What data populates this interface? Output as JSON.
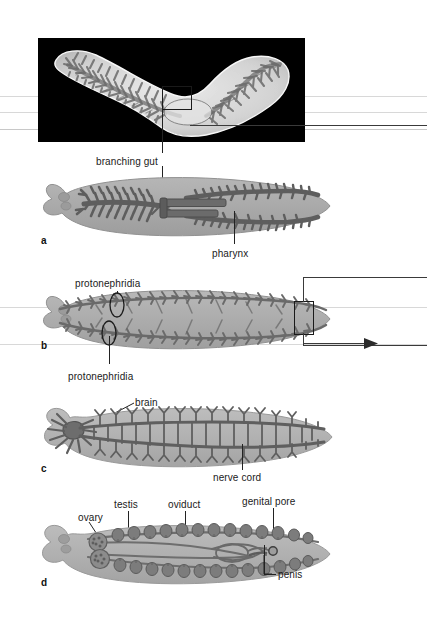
{
  "figure": {
    "type": "biological-anatomy-plate",
    "panel_count": 4
  },
  "photo": {
    "name": "micrograph",
    "description": "stained whole-mount light micrograph of a planarian showing branching gut on black background",
    "background_color": "#000000",
    "specimen_color": "#e8e8e8",
    "gut_color": "#6d6d6d",
    "callout_label": "branching gut"
  },
  "colors": {
    "body": "#a9a9a9",
    "body_light": "#c2c2c2",
    "body_edge": "#8f8f8f",
    "organ_dark": "#5e5e5e",
    "organ_mid": "#787878",
    "organ_light": "#9a9a9a",
    "leader": "#222222",
    "rule": "#d8d8d8",
    "text": "#1a1a1a"
  },
  "panels": [
    {
      "letter": "a",
      "name": "digestive-system-panel",
      "system": "digestive system",
      "labels": [
        {
          "text": "branching gut",
          "x": 96,
          "y": 157
        },
        {
          "text": "pharynx",
          "x": 212,
          "y": 249
        }
      ]
    },
    {
      "letter": "b",
      "name": "excretory-system-panel",
      "system": "excretory system",
      "labels": [
        {
          "text": "protonephridia",
          "x": 75,
          "y": 279
        },
        {
          "text": "protonephridia",
          "x": 68,
          "y": 372
        }
      ]
    },
    {
      "letter": "c",
      "name": "nervous-system-panel",
      "system": "nervous system",
      "labels": [
        {
          "text": "brain",
          "x": 135,
          "y": 398
        },
        {
          "text": "nerve cord",
          "x": 213,
          "y": 473
        }
      ]
    },
    {
      "letter": "d",
      "name": "reproductive-system-panel",
      "system": "reproductive system",
      "labels": [
        {
          "text": "ovary",
          "x": 78,
          "y": 513
        },
        {
          "text": "testis",
          "x": 114,
          "y": 500
        },
        {
          "text": "oviduct",
          "x": 168,
          "y": 500
        },
        {
          "text": "genital pore",
          "x": 242,
          "y": 497
        },
        {
          "text": "penis",
          "x": 268,
          "y": 573
        }
      ]
    }
  ],
  "letters": {
    "a": "a",
    "b": "b",
    "c": "c",
    "d": "d"
  }
}
